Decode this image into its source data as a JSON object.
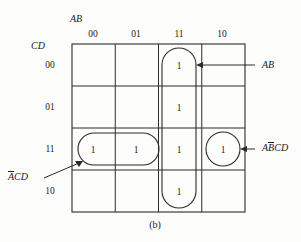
{
  "figure": {
    "caption": "(b)",
    "type": "karnaugh-map",
    "col_var_label": "AB",
    "row_var_label": "CD",
    "col_headers": [
      "00",
      "01",
      "11",
      "10"
    ],
    "row_headers": [
      "00",
      "01",
      "11",
      "10"
    ]
  },
  "cells": {
    "r0c2": "1",
    "r1c2": "1",
    "r2c0": "1",
    "r2c1": "1",
    "r2c2": "1",
    "r2c3": "1",
    "r3c2": "1"
  },
  "groupings": [
    {
      "id": "group-ab",
      "shape": "vertical-oval",
      "label": "AB",
      "label_overbar_index": -1,
      "cells": [
        "r0c2",
        "r1c2",
        "r2c2",
        "r3c2"
      ]
    },
    {
      "id": "group-not-a-c-d",
      "shape": "horizontal-oval",
      "label_pre": "A",
      "label_post": "CD",
      "cells": [
        "r2c0",
        "r2c1"
      ]
    },
    {
      "id": "group-a-not-b-c-d",
      "shape": "circle",
      "label_pre": "A",
      "label_bar": "B",
      "label_post": "CD",
      "cells": [
        "r2c3"
      ]
    }
  ],
  "annotations": {
    "ab": "AB",
    "acd_a": "A",
    "acd_rest": "CD",
    "abcd_a": "A",
    "abcd_b": "B",
    "abcd_rest": "CD"
  },
  "colors": {
    "stroke": "#2b2b2b",
    "text": "#1a1a1a",
    "background": "#fdfdfb"
  }
}
